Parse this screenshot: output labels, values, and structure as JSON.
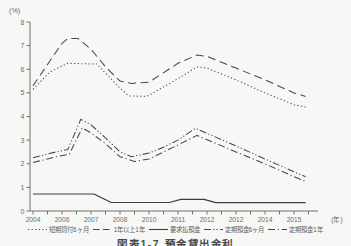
{
  "figure": {
    "caption": "図表1-7 預金貸出金利"
  },
  "colors": {
    "background": "#f7f7f5",
    "axis": "#6e6e6e",
    "tick_text": "#6b6b6b",
    "line": "#474747",
    "solid_line": "#3d3d3d",
    "caption_text": "#4a4a4a"
  },
  "chart_data": {
    "type": "line",
    "title": "図表1-7 預金貸出金利",
    "y_unit": "(%)",
    "x_unit": "(年)",
    "ylim": [
      0,
      8
    ],
    "yticks": [
      0,
      1,
      2,
      3,
      4,
      5,
      6,
      7,
      8
    ],
    "x_labels": [
      "2004",
      "2006",
      "2007",
      "2008",
      "2010",
      "2011",
      "2012",
      "2012",
      "2014",
      "2015"
    ],
    "grid": false,
    "legend_position": "bottom",
    "series": [
      {
        "name": "短期貸付6ヶ月",
        "line_style": "dotted",
        "color": "#474747",
        "points": [
          [
            0,
            5.15
          ],
          [
            0.6,
            5.9
          ],
          [
            1.2,
            6.25
          ],
          [
            2.2,
            6.22
          ],
          [
            3,
            5.2
          ],
          [
            3.3,
            4.87
          ],
          [
            3.9,
            4.85
          ],
          [
            4,
            4.9
          ],
          [
            5,
            5.6
          ],
          [
            5.65,
            6.1
          ],
          [
            6,
            6.05
          ],
          [
            7,
            5.55
          ],
          [
            8,
            5.0
          ],
          [
            9,
            4.5
          ],
          [
            9.4,
            4.4
          ]
        ]
      },
      {
        "name": "1年以上1年",
        "line_style": "dashed",
        "color": "#474747",
        "points": [
          [
            0,
            5.3
          ],
          [
            0.5,
            6.2
          ],
          [
            1,
            7.1
          ],
          [
            1.2,
            7.3
          ],
          [
            1.55,
            7.3
          ],
          [
            2,
            6.85
          ],
          [
            2.5,
            6.1
          ],
          [
            3,
            5.5
          ],
          [
            3.4,
            5.4
          ],
          [
            4,
            5.45
          ],
          [
            5,
            6.25
          ],
          [
            5.65,
            6.6
          ],
          [
            6,
            6.55
          ],
          [
            7,
            6.05
          ],
          [
            8,
            5.55
          ],
          [
            9,
            5.0
          ],
          [
            9.4,
            4.85
          ]
        ]
      },
      {
        "name": "要求払預金",
        "line_style": "solid",
        "color": "#3d3d3d",
        "points": [
          [
            0,
            0.72
          ],
          [
            2.1,
            0.72
          ],
          [
            2.7,
            0.36
          ],
          [
            4.7,
            0.36
          ],
          [
            5.1,
            0.49
          ],
          [
            5.9,
            0.49
          ],
          [
            6.3,
            0.35
          ],
          [
            9.4,
            0.35
          ]
        ]
      },
      {
        "name": "定期預金6ヶ月",
        "line_style": "dash-dot-dot",
        "color": "#474747",
        "points": [
          [
            0,
            2.25
          ],
          [
            0.8,
            2.5
          ],
          [
            1.2,
            2.6
          ],
          [
            1.65,
            3.88
          ],
          [
            2,
            3.65
          ],
          [
            2.5,
            3.1
          ],
          [
            3,
            2.5
          ],
          [
            3.4,
            2.3
          ],
          [
            4,
            2.45
          ],
          [
            4.5,
            2.7
          ],
          [
            5,
            3.0
          ],
          [
            5.6,
            3.5
          ],
          [
            7,
            2.75
          ],
          [
            8,
            2.2
          ],
          [
            9,
            1.66
          ],
          [
            9.4,
            1.45
          ]
        ]
      },
      {
        "name": "定期預金1年",
        "line_style": "dash-dot",
        "color": "#474747",
        "points": [
          [
            0,
            2.05
          ],
          [
            0.8,
            2.3
          ],
          [
            1.25,
            2.4
          ],
          [
            1.7,
            3.52
          ],
          [
            2,
            3.3
          ],
          [
            2.5,
            2.85
          ],
          [
            3,
            2.3
          ],
          [
            3.5,
            2.1
          ],
          [
            4,
            2.2
          ],
          [
            5,
            2.8
          ],
          [
            5.65,
            3.2
          ],
          [
            7,
            2.5
          ],
          [
            8,
            2.0
          ],
          [
            9,
            1.45
          ],
          [
            9.4,
            1.25
          ]
        ]
      }
    ]
  }
}
